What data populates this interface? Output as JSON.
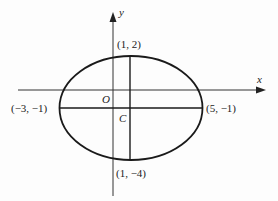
{
  "diagram": {
    "type": "ellipse-on-axes",
    "axes": {
      "x_label": "x",
      "y_label": "y",
      "origin_label": "O"
    },
    "center_label": "C",
    "points": {
      "top": "(1, 2)",
      "left": "(−3, −1)",
      "right": "(5, −1)",
      "bottom": "(1, −4)"
    },
    "colors": {
      "stroke": "#1a1a1a",
      "axis": "#333333",
      "background": "#fdfdfd"
    }
  }
}
